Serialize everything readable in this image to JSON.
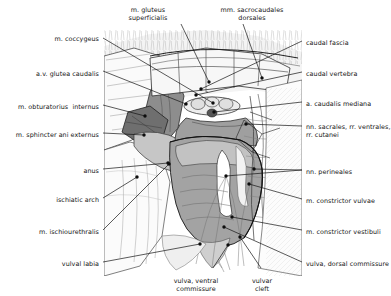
{
  "figure": {
    "background_color": "#ffffff",
    "line_color": "#1a1a1a",
    "label_color": "#141414",
    "shading": {
      "muscle_dark": "#6f6f6f",
      "muscle_mid": "#9a9a9a",
      "muscle_light": "#bdbdbd",
      "tissue_pale": "#e2e2e2",
      "highlight": "#ffffff"
    }
  },
  "labels": {
    "left": [
      {
        "id": "m-coccygeus",
        "text": "m. coccygeus",
        "x": 99,
        "y": 35,
        "align": "right"
      },
      {
        "id": "av-glutea-caudalis",
        "text": "a.v. glutea caudalis",
        "x": 99,
        "y": 70,
        "align": "right"
      },
      {
        "id": "m-obturatorius-internus",
        "text": "m. obturatorius  internus",
        "x": 99,
        "y": 103,
        "align": "right"
      },
      {
        "id": "m-sphincter-ani-externus",
        "text": "m. sphincter ani externus",
        "x": 99,
        "y": 131,
        "align": "right"
      },
      {
        "id": "anus",
        "text": "anus",
        "x": 99,
        "y": 167,
        "align": "right"
      },
      {
        "id": "ischiatic-arch",
        "text": "ischiatic arch",
        "x": 99,
        "y": 196,
        "align": "right"
      },
      {
        "id": "m-ischiourethralis",
        "text": "m. ischiourethralis",
        "x": 99,
        "y": 228,
        "align": "right"
      },
      {
        "id": "vulval-labia",
        "text": "vulval labia",
        "x": 99,
        "y": 260,
        "align": "right"
      }
    ],
    "right": [
      {
        "id": "caudal-fascia",
        "text": "caudal fascia",
        "x": 306,
        "y": 39,
        "align": "left"
      },
      {
        "id": "caudal-vertebra",
        "text": "caudal vertebra",
        "x": 306,
        "y": 70,
        "align": "left"
      },
      {
        "id": "a-caudalis-mediana",
        "text": "a. caudalis mediana",
        "x": 306,
        "y": 100,
        "align": "left"
      },
      {
        "id": "nn-sacrales",
        "text": "nn. sacrales, rr. ventrales,\nrr. cutanei",
        "x": 306,
        "y": 123,
        "align": "left"
      },
      {
        "id": "nn-perineales",
        "text": "nn. perineales",
        "x": 306,
        "y": 168,
        "align": "left"
      },
      {
        "id": "m-constrictor-vulvae",
        "text": "m. constrictor vulvae",
        "x": 306,
        "y": 197,
        "align": "left"
      },
      {
        "id": "m-constrictor-vestibuli",
        "text": "m. constrictor vestibuli",
        "x": 306,
        "y": 228,
        "align": "left"
      },
      {
        "id": "vulva-dorsal-commissure",
        "text": "vulva, dorsal commissure",
        "x": 306,
        "y": 260,
        "align": "left"
      }
    ],
    "top": [
      {
        "id": "m-gluteus-superficialis",
        "text": "m. gluteus\nsuperficialis",
        "x": 148,
        "y": 6,
        "align": "center"
      },
      {
        "id": "mm-sacrocaudales-dorsales",
        "text": "mm. sacrocaudales\ndorsales",
        "x": 252,
        "y": 6,
        "align": "center"
      }
    ],
    "bottom": [
      {
        "id": "vulva-ventral-commissure",
        "text": "vulva, ventral\ncommissure",
        "x": 196,
        "y": 277,
        "align": "center"
      },
      {
        "id": "vulvar-cleft",
        "text": "vulvar\ncleft",
        "x": 262,
        "y": 277,
        "align": "center"
      }
    ]
  },
  "leaders": [
    {
      "id": "leader-m-coccygeus",
      "from": [
        103,
        38
      ],
      "to": [
        213,
        103
      ],
      "dot": true
    },
    {
      "id": "leader-av-glutea-caudalis",
      "from": [
        103,
        71
      ],
      "to": [
        186,
        104
      ],
      "dot": true
    },
    {
      "id": "leader-m-obturatorius-internus",
      "from": [
        103,
        105
      ],
      "to": [
        145,
        116
      ],
      "dot": true
    },
    {
      "id": "leader-m-sphincter-ani-externus",
      "from": [
        103,
        133
      ],
      "to": [
        144,
        135
      ],
      "dot": true
    },
    {
      "id": "leader-anus",
      "from": [
        103,
        169
      ],
      "to": [
        168,
        163
      ],
      "dot": true
    },
    {
      "id": "leader-ischiatic-arch",
      "from": [
        103,
        198
      ],
      "to": [
        137,
        177
      ],
      "dot": true
    },
    {
      "id": "leader-m-ischiourethralis",
      "from": [
        103,
        230
      ],
      "to": [
        169,
        164
      ],
      "dot": true
    },
    {
      "id": "leader-vulval-labia",
      "from": [
        103,
        262
      ],
      "to": [
        200,
        244
      ],
      "dot": true
    },
    {
      "id": "leader-caudal-fascia",
      "from": [
        302,
        41
      ],
      "to": [
        201,
        89
      ],
      "dot": true
    },
    {
      "id": "leader-caudal-vertebra",
      "from": [
        302,
        72
      ],
      "to": [
        196,
        95
      ],
      "dot": true
    },
    {
      "id": "leader-a-caudalis-mediana",
      "from": [
        302,
        102
      ],
      "to": [
        214,
        112
      ],
      "dot": true
    },
    {
      "id": "leader-nn-sacrales",
      "from": [
        302,
        126
      ],
      "to": [
        246,
        124
      ],
      "dot": true
    },
    {
      "id": "leader-nn-perineales",
      "from": [
        302,
        170
      ],
      "to": [
        226,
        176
      ],
      "dot": true
    },
    {
      "id": "leader-nn-perineales-b",
      "from": [
        302,
        170
      ],
      "to": [
        254,
        169
      ],
      "dot": true
    },
    {
      "id": "leader-m-constrictor-vulvae",
      "from": [
        302,
        199
      ],
      "to": [
        249,
        184
      ],
      "dot": true
    },
    {
      "id": "leader-m-constrictor-vestibuli",
      "from": [
        302,
        230
      ],
      "to": [
        232,
        217
      ],
      "dot": true
    },
    {
      "id": "leader-vulva-dorsal-commissure",
      "from": [
        302,
        262
      ],
      "to": [
        224,
        227
      ],
      "dot": true
    },
    {
      "id": "leader-m-gluteus-superficialis",
      "from": [
        181,
        24
      ],
      "to": [
        209,
        82
      ],
      "dot": true
    },
    {
      "id": "leader-mm-sacrocaudales-dorsales",
      "from": [
        243,
        24
      ],
      "to": [
        262,
        78
      ],
      "dot": true
    },
    {
      "id": "leader-vulva-ventral-commissure",
      "from": [
        213,
        268
      ],
      "to": [
        228,
        245
      ],
      "dot": true
    },
    {
      "id": "leader-vulvar-cleft",
      "from": [
        261,
        268
      ],
      "to": [
        240,
        237
      ],
      "dot": true
    }
  ]
}
